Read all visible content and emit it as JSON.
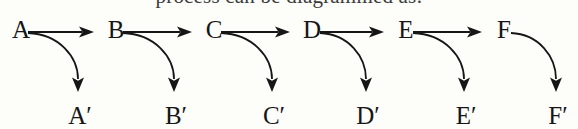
{
  "page": {
    "width": 578,
    "height": 129,
    "background_color": "#fdfdfa",
    "ink_color": "#161616"
  },
  "clipped_header_text": "process can be diagrammed as:",
  "diagram": {
    "type": "chain-with-branches",
    "top_row_baseline_y": 38,
    "bottom_row_baseline_y": 124,
    "nodes": [
      {
        "id": "A",
        "label": "A",
        "x": 13,
        "image_label": "A′",
        "image_x": 78,
        "arrow_head_x": 78
      },
      {
        "id": "B",
        "label": "B",
        "x": 108,
        "image_label": "B′",
        "image_x": 174,
        "arrow_head_x": 174
      },
      {
        "id": "C",
        "label": "C",
        "x": 206,
        "image_label": "C′",
        "image_x": 272,
        "arrow_head_x": 272
      },
      {
        "id": "D",
        "label": "D",
        "x": 304,
        "image_label": "D′",
        "image_x": 366,
        "arrow_head_x": 366
      },
      {
        "id": "E",
        "label": "E",
        "x": 398,
        "image_label": "E′",
        "image_x": 464,
        "arrow_head_x": 464
      },
      {
        "id": "F",
        "label": "F",
        "x": 496,
        "image_label": "F′",
        "image_x": 556,
        "arrow_head_x": 556
      }
    ],
    "straight_arrows": [
      {
        "from": "A",
        "to": "B",
        "x1": 28,
        "x2": 94,
        "y": 32
      },
      {
        "from": "B",
        "to": "C",
        "x1": 123,
        "x2": 192,
        "y": 32
      },
      {
        "from": "C",
        "to": "D",
        "x1": 221,
        "x2": 290,
        "y": 32
      },
      {
        "from": "D",
        "to": "E",
        "x1": 320,
        "x2": 384,
        "y": 32
      },
      {
        "from": "E",
        "to": "F",
        "x1": 413,
        "x2": 482,
        "y": 32
      }
    ],
    "curved_arrows": [
      {
        "from": "A",
        "to": "A′",
        "start_x": 28,
        "start_y": 33,
        "end_x": 78,
        "end_y": 92
      },
      {
        "from": "B",
        "to": "B′",
        "start_x": 123,
        "start_y": 33,
        "end_x": 174,
        "end_y": 92
      },
      {
        "from": "C",
        "to": "C′",
        "start_x": 221,
        "start_y": 33,
        "end_x": 272,
        "end_y": 92
      },
      {
        "from": "D",
        "to": "D′",
        "start_x": 320,
        "start_y": 33,
        "end_x": 366,
        "end_y": 92
      },
      {
        "from": "E",
        "to": "E′",
        "start_x": 413,
        "start_y": 33,
        "end_x": 464,
        "end_y": 92
      },
      {
        "from": "F",
        "to": "F′",
        "start_x": 511,
        "start_y": 33,
        "end_x": 556,
        "end_y": 92
      }
    ]
  }
}
